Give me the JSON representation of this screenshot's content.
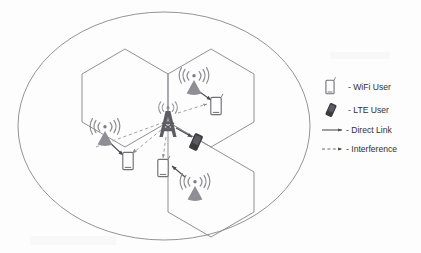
{
  "figure": {
    "type": "network-topology-diagram",
    "boundary_shape": "ellipse",
    "cell_shape": "hexagon",
    "cell_count": 3
  },
  "colors": {
    "outline": "#8d8d92",
    "hex_stroke": "#8a8a90",
    "device_stroke": "#6f6f75",
    "ap_fill": "#8e8e94",
    "tower_fill": "#5d5d63",
    "lte_user_fill": "#3a3a3f",
    "link_solid": "#4a4a50",
    "link_dashed": "#9b9ba1",
    "text": "#2f2f33",
    "background": "#fdfdfd"
  },
  "nodes": [
    {
      "id": "macro-tower",
      "kind": "lte-tower",
      "label": "LTE Base Station",
      "cell": "macro",
      "x": 168,
      "y": 122
    },
    {
      "id": "ap-top",
      "kind": "wifi-ap",
      "label": "WiFi Access Point",
      "cell": "top",
      "x": 194,
      "y": 80
    },
    {
      "id": "ap-left",
      "kind": "wifi-ap",
      "label": "WiFi Access Point",
      "cell": "left",
      "x": 105,
      "y": 131
    },
    {
      "id": "ap-bottom",
      "kind": "wifi-ap",
      "label": "WiFi Access Point",
      "cell": "bottom",
      "x": 195,
      "y": 186
    },
    {
      "id": "user-wifi-top",
      "kind": "wifi-user",
      "label": "WiFi User",
      "cell": "top",
      "x": 216,
      "y": 106
    },
    {
      "id": "user-wifi-left",
      "kind": "wifi-user",
      "label": "WiFi User",
      "cell": "left",
      "x": 128,
      "y": 161
    },
    {
      "id": "user-wifi-bottom",
      "kind": "wifi-user",
      "label": "WiFi User",
      "cell": "bottom",
      "x": 163,
      "y": 168
    },
    {
      "id": "user-lte",
      "kind": "lte-user",
      "label": "LTE User",
      "cell": "macro",
      "x": 196,
      "y": 142
    }
  ],
  "links": [
    {
      "from": "ap-top",
      "to": "user-wifi-top",
      "type": "direct",
      "style": "solid"
    },
    {
      "from": "ap-left",
      "to": "user-wifi-left",
      "type": "direct",
      "style": "solid"
    },
    {
      "from": "ap-bottom",
      "to": "user-wifi-bottom",
      "type": "direct",
      "style": "solid"
    },
    {
      "from": "macro-tower",
      "to": "user-lte",
      "type": "direct",
      "style": "solid"
    },
    {
      "from": "macro-tower",
      "to": "user-wifi-top",
      "type": "interference",
      "style": "dashed"
    },
    {
      "from": "macro-tower",
      "to": "user-wifi-left",
      "type": "interference",
      "style": "dashed"
    },
    {
      "from": "macro-tower",
      "to": "user-wifi-bottom",
      "type": "interference",
      "style": "dashed"
    }
  ],
  "legend": {
    "items": [
      {
        "key": "wifi-user",
        "icon": "phone-outline-icon",
        "label": "- WiFi User"
      },
      {
        "key": "lte-user",
        "icon": "phone-filled-icon",
        "label": "- LTE User"
      },
      {
        "key": "direct",
        "icon": "solid-arrow-icon",
        "label": "- Direct Link"
      },
      {
        "key": "interference",
        "icon": "dashed-arrow-icon",
        "label": "- Interference"
      }
    ]
  }
}
